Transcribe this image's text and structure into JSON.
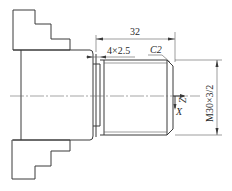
{
  "drawing": {
    "title": "Threaded shaft turning diagram",
    "dimensions": {
      "length": "32",
      "undercut": "4×2.5",
      "chamfer": "C2",
      "thread": "M30×3/2"
    },
    "axes": {
      "z_label": "Z",
      "x_label": "X"
    }
  }
}
